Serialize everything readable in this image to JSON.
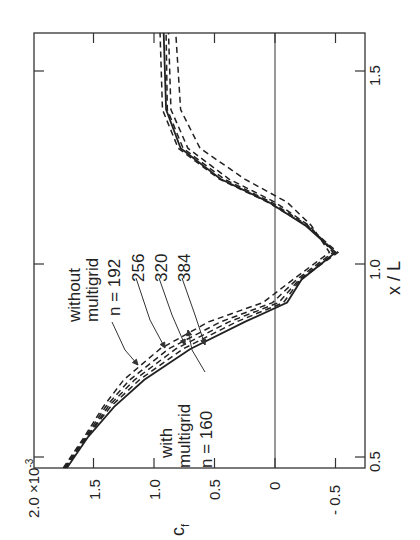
{
  "chart_data": {
    "type": "line",
    "orientation": "rotated 90 degrees counterclockwise (x/L axis vertical, c_f axis horizontal)",
    "title": "",
    "xlabel": "x / L",
    "ylabel": "c_f",
    "y_multiplier_label": "2.0 × 10^-3",
    "xlim": [
      0.47,
      1.6
    ],
    "ylim": [
      -0.7,
      2.0
    ],
    "x_ticks": [
      "0.5",
      "1.0",
      "1.5"
    ],
    "y_ticks": [
      "2.0 ×10^-3",
      "1.5",
      "1.0",
      "0.5",
      "0",
      "-0.5"
    ],
    "grid": false,
    "reference_lines": [
      {
        "axis": "y",
        "value": 0
      }
    ],
    "series": [
      {
        "name": "with multigrid n = 160",
        "style": "solid",
        "x": [
          0.47,
          0.55,
          0.63,
          0.7,
          0.78,
          0.85,
          0.9,
          0.96,
          1.03,
          1.1,
          1.16,
          1.22,
          1.3,
          1.4,
          1.6
        ],
        "y": [
          1.72,
          1.55,
          1.33,
          1.08,
          0.7,
          0.25,
          -0.1,
          -0.22,
          -0.5,
          -0.25,
          0.05,
          0.45,
          0.78,
          0.9,
          0.92
        ]
      },
      {
        "name": "without multigrid n = 192",
        "style": "dashed",
        "x": [
          0.47,
          0.55,
          0.63,
          0.7,
          0.78,
          0.85,
          0.9,
          0.96,
          1.03,
          1.1,
          1.16,
          1.22,
          1.3,
          1.4,
          1.6
        ],
        "y": [
          1.75,
          1.58,
          1.42,
          1.25,
          0.95,
          0.55,
          0.1,
          -0.15,
          -0.45,
          -0.3,
          -0.1,
          0.25,
          0.62,
          0.78,
          0.82
        ]
      },
      {
        "name": "without multigrid n = 256",
        "style": "dashed",
        "x": [
          0.47,
          0.55,
          0.63,
          0.7,
          0.78,
          0.85,
          0.9,
          0.96,
          1.03,
          1.1,
          1.16,
          1.22,
          1.3,
          1.4,
          1.6
        ],
        "y": [
          1.74,
          1.57,
          1.4,
          1.2,
          0.88,
          0.45,
          0.02,
          -0.18,
          -0.48,
          -0.28,
          0.0,
          0.38,
          0.72,
          0.86,
          0.88
        ]
      },
      {
        "name": "without multigrid n = 320",
        "style": "dashed",
        "x": [
          0.47,
          0.55,
          0.63,
          0.7,
          0.78,
          0.85,
          0.9,
          0.96,
          1.03,
          1.1,
          1.16,
          1.22,
          1.3,
          1.4,
          1.6
        ],
        "y": [
          1.74,
          1.56,
          1.38,
          1.16,
          0.82,
          0.38,
          -0.03,
          -0.2,
          -0.5,
          -0.27,
          0.03,
          0.42,
          0.76,
          0.89,
          0.9
        ]
      },
      {
        "name": "without multigrid n = 384",
        "style": "dashed",
        "x": [
          0.47,
          0.55,
          0.63,
          0.7,
          0.78,
          0.85,
          0.9,
          0.96,
          1.03,
          1.1,
          1.16,
          1.22,
          1.3,
          1.4,
          1.6
        ],
        "y": [
          1.73,
          1.56,
          1.36,
          1.12,
          0.76,
          0.32,
          -0.07,
          -0.21,
          -0.52,
          -0.26,
          0.06,
          0.46,
          0.8,
          0.93,
          0.95
        ]
      }
    ],
    "annotations": [
      {
        "text": "without multigrid",
        "points_to": "dashed curves"
      },
      {
        "text": "n = 192",
        "points_to": "without multigrid n = 192"
      },
      {
        "text": "256",
        "points_to": "without multigrid n = 256"
      },
      {
        "text": "320",
        "points_to": "without multigrid n = 320"
      },
      {
        "text": "384",
        "points_to": "without multigrid n = 384"
      },
      {
        "text": "with multigrid",
        "points_to": "solid curve"
      },
      {
        "text": "n = 160",
        "points_to": "with multigrid n = 160"
      }
    ]
  },
  "labels": {
    "xlabel": "x / L",
    "ylabel": "c",
    "ylabel_sub": "f",
    "y_top_label": "2.0 ×10",
    "y_top_exp": "-3",
    "x_ticks": [
      "0.5",
      "1.0",
      "1.5"
    ],
    "y_ticks": [
      "1.5",
      "1.0",
      "0.5",
      "0",
      "- 0.5"
    ],
    "ann_without_1": "without",
    "ann_without_2": "multigrid",
    "ann_n192": "n = 192",
    "ann_256": "256",
    "ann_320": "320",
    "ann_384": "384",
    "ann_with_1": "with",
    "ann_with_2": "multigrid",
    "ann_n160": "n = 160"
  }
}
